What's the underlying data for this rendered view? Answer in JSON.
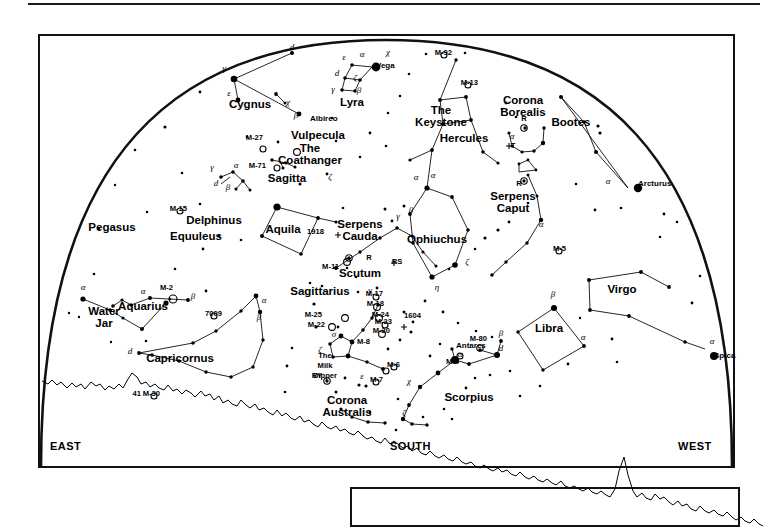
{
  "chart": {
    "type": "sky-map",
    "projection": "half-dome horizon view",
    "cardinals": {
      "left": "EAST",
      "center": "SOUTH",
      "right": "WEST"
    }
  },
  "constellations": [
    {
      "name": "Cygnus",
      "x": 250,
      "y": 108
    },
    {
      "name": "Lyra",
      "x": 352,
      "y": 106
    },
    {
      "name": "Vulpecula",
      "x": 318,
      "y": 139
    },
    {
      "name": "Sagitta",
      "x": 287,
      "y": 182
    },
    {
      "name": "Pegasus",
      "x": 112,
      "y": 231
    },
    {
      "name": "Delphinus",
      "x": 214,
      "y": 224
    },
    {
      "name": "Equuleus",
      "x": 196,
      "y": 240
    },
    {
      "name": "Aquila",
      "x": 283,
      "y": 233
    },
    {
      "name": "Aquarius",
      "x": 143,
      "y": 310
    },
    {
      "name": "Capricornus",
      "x": 180,
      "y": 362
    },
    {
      "name": "Sagittarius",
      "x": 320,
      "y": 295
    },
    {
      "name": "Scutum",
      "x": 360,
      "y": 277
    },
    {
      "name": "Ophiuchus",
      "x": 437,
      "y": 243
    },
    {
      "name": "Hercules",
      "x": 464,
      "y": 142
    },
    {
      "name": "Corona Borealis",
      "x": 523,
      "y": 104
    },
    {
      "name": "Bootes",
      "x": 571,
      "y": 126
    },
    {
      "name": "Virgo",
      "x": 622,
      "y": 293
    },
    {
      "name": "Libra",
      "x": 549,
      "y": 332
    },
    {
      "name": "Scorpius",
      "x": 469,
      "y": 401
    },
    {
      "name": "Corona Australis",
      "x": 347,
      "y": 404
    }
  ],
  "constellations_two_line": [
    {
      "line1": "Serpens",
      "line2": "Cauda",
      "x": 360,
      "y": 228
    },
    {
      "line1": "Serpens",
      "line2": "Caput",
      "x": 513,
      "y": 200
    },
    {
      "line1": "Corona",
      "line2": "Borealis",
      "x": 523,
      "y": 104
    },
    {
      "line1": "Corona",
      "line2": "Australis",
      "x": 347,
      "y": 404
    },
    {
      "line1": "The",
      "line2": "Keystone",
      "x": 441,
      "y": 114
    },
    {
      "line1": "Water",
      "line2": "Jar",
      "x": 104,
      "y": 315
    },
    {
      "line1": "The",
      "line2": "Coathanger",
      "x": 310,
      "y": 152
    }
  ],
  "named_stars": [
    {
      "name": "Vega",
      "x": 376,
      "y": 68,
      "bayer": "α"
    },
    {
      "name": "Albireo",
      "x": 310,
      "y": 121,
      "bayer": "β"
    },
    {
      "name": "Arcturus",
      "x": 638,
      "y": 186,
      "bayer": "α"
    },
    {
      "name": "Spica",
      "x": 714,
      "y": 358,
      "bayer": "α"
    },
    {
      "name": "Antares",
      "x": 456,
      "y": 348,
      "bayer": "α"
    }
  ],
  "milk_dipper": {
    "line1": "The",
    "line2": "Milk",
    "line3": "Dipper",
    "x": 325,
    "y": 358
  },
  "deep_sky_objects": [
    {
      "label": "M-92",
      "x": 452,
      "y": 55
    },
    {
      "label": "M-13",
      "x": 478,
      "y": 85
    },
    {
      "label": "M-27",
      "x": 263,
      "y": 140
    },
    {
      "label": "M-71",
      "x": 266,
      "y": 168
    },
    {
      "label": "M-15",
      "x": 187,
      "y": 211
    },
    {
      "label": "M-2",
      "x": 173,
      "y": 290
    },
    {
      "label": "7009",
      "x": 222,
      "y": 316
    },
    {
      "label": "M-30",
      "x": 160,
      "y": 396
    },
    {
      "label": "41",
      "x": 141,
      "y": 396
    },
    {
      "label": "M-5",
      "x": 566,
      "y": 251
    },
    {
      "label": "M-11",
      "x": 339,
      "y": 269
    },
    {
      "label": "1918",
      "x": 324,
      "y": 234
    },
    {
      "label": "M-25",
      "x": 322,
      "y": 317
    },
    {
      "label": "M-22",
      "x": 325,
      "y": 327
    },
    {
      "label": "M-17",
      "x": 383,
      "y": 296
    },
    {
      "label": "M-18",
      "x": 384,
      "y": 306
    },
    {
      "label": "M-24",
      "x": 389,
      "y": 317
    },
    {
      "label": "M-23",
      "x": 392,
      "y": 324
    },
    {
      "label": "M-20",
      "x": 390,
      "y": 333
    },
    {
      "label": "M-8",
      "x": 370,
      "y": 344
    },
    {
      "label": "M-6",
      "x": 400,
      "y": 367
    },
    {
      "label": "M-7",
      "x": 383,
      "y": 382
    },
    {
      "label": "M-4",
      "x": 459,
      "y": 364
    },
    {
      "label": "M-80",
      "x": 487,
      "y": 341
    },
    {
      "label": "1604",
      "x": 421,
      "y": 318
    }
  ],
  "variable_stars": [
    {
      "label": "R",
      "x": 524,
      "y": 121
    },
    {
      "label": "T",
      "x": 513,
      "y": 148
    },
    {
      "label": "R",
      "x": 519,
      "y": 186
    },
    {
      "label": "R",
      "x": 369,
      "y": 260
    },
    {
      "label": "RS",
      "x": 397,
      "y": 264
    },
    {
      "label": "RY",
      "x": 317,
      "y": 378
    }
  ],
  "greek_labels": [
    {
      "g": "d",
      "x": 292,
      "y": 50
    },
    {
      "g": "γ",
      "x": 224,
      "y": 71
    },
    {
      "g": "ε",
      "x": 229,
      "y": 96
    },
    {
      "g": "χ",
      "x": 288,
      "y": 105
    },
    {
      "g": "β",
      "x": 296,
      "y": 118
    },
    {
      "g": "ε",
      "x": 344,
      "y": 60
    },
    {
      "g": "α",
      "x": 362,
      "y": 57
    },
    {
      "g": "d",
      "x": 337,
      "y": 76
    },
    {
      "g": "ζ",
      "x": 355,
      "y": 81
    },
    {
      "g": "γ",
      "x": 333,
      "y": 92
    },
    {
      "g": "β",
      "x": 359,
      "y": 93
    },
    {
      "g": "χ",
      "x": 388,
      "y": 55
    },
    {
      "g": "γ",
      "x": 212,
      "y": 170
    },
    {
      "g": "α",
      "x": 236,
      "y": 168
    },
    {
      "g": "d",
      "x": 216,
      "y": 186
    },
    {
      "g": "β",
      "x": 228,
      "y": 190
    },
    {
      "g": "ζ",
      "x": 330,
      "y": 180
    },
    {
      "g": "α",
      "x": 83,
      "y": 290
    },
    {
      "g": "α",
      "x": 143,
      "y": 294
    },
    {
      "g": "β",
      "x": 193,
      "y": 299
    },
    {
      "g": "α",
      "x": 264,
      "y": 303
    },
    {
      "g": "β",
      "x": 259,
      "y": 320
    },
    {
      "g": "d",
      "x": 130,
      "y": 354
    },
    {
      "g": "α",
      "x": 416,
      "y": 180
    },
    {
      "g": "β",
      "x": 411,
      "y": 213
    },
    {
      "g": "γ",
      "x": 398,
      "y": 219
    },
    {
      "g": "α",
      "x": 433,
      "y": 178
    },
    {
      "g": "η",
      "x": 437,
      "y": 290
    },
    {
      "g": "ζ",
      "x": 467,
      "y": 265
    },
    {
      "g": "α",
      "x": 541,
      "y": 227
    },
    {
      "g": "γ",
      "x": 370,
      "y": 293
    },
    {
      "g": "σ",
      "x": 334,
      "y": 337
    },
    {
      "g": "ζ",
      "x": 320,
      "y": 353
    },
    {
      "g": "ε",
      "x": 362,
      "y": 379
    },
    {
      "g": "α",
      "x": 460,
      "y": 357
    },
    {
      "g": "β",
      "x": 501,
      "y": 336
    },
    {
      "g": "d",
      "x": 501,
      "y": 351
    },
    {
      "g": "χ",
      "x": 409,
      "y": 384
    },
    {
      "g": "ζ",
      "x": 404,
      "y": 416
    },
    {
      "g": "β",
      "x": 553,
      "y": 297
    },
    {
      "g": "α",
      "x": 583,
      "y": 340
    },
    {
      "g": "α",
      "x": 712,
      "y": 344
    },
    {
      "g": "α",
      "x": 608,
      "y": 184
    },
    {
      "g": "α",
      "x": 512,
      "y": 139
    }
  ],
  "colors": {
    "ink": "#000000",
    "frame": "#111111",
    "background": "#ffffff"
  }
}
